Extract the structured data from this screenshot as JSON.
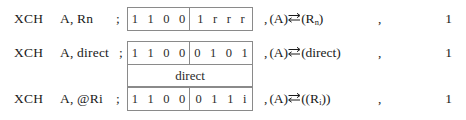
{
  "table": {
    "rows": [
      {
        "mnemonic_op": "XCH",
        "mnemonic_args": "A, Rn",
        "separator": ";",
        "opcode_high": "1 1 0 0",
        "opcode_low": "1 r r r",
        "operand_byte": null,
        "operation_prefix": ",",
        "operation_left": "(A)",
        "operation_symbol": "swap-arrows",
        "operation_right_pre": "(R",
        "operation_right_sub": "n",
        "operation_right_post": ")",
        "trailing_comma": ",",
        "cycles": "1"
      },
      {
        "mnemonic_op": "XCH",
        "mnemonic_args": "A, direct",
        "separator": ";",
        "opcode_high": "1 1 0 0",
        "opcode_low": "0 1 0 1",
        "operand_byte": "direct",
        "operation_prefix": ",",
        "operation_left": "(A)",
        "operation_symbol": "swap-arrows",
        "operation_right_pre": "(direct",
        "operation_right_sub": "",
        "operation_right_post": ")",
        "trailing_comma": ",",
        "cycles": "1"
      },
      {
        "mnemonic_op": "XCH",
        "mnemonic_args": "A, @Ri",
        "separator": ";",
        "opcode_high": "1 1 0 0",
        "opcode_low": "0 1 1 i",
        "operand_byte": null,
        "operation_prefix": ",",
        "operation_left": "(A)",
        "operation_symbol": "swap-arrows",
        "operation_right_pre": "((R",
        "operation_right_sub": "i",
        "operation_right_post": "))",
        "trailing_comma": ",",
        "cycles": "1"
      }
    ]
  },
  "colors": {
    "text": "#1a1a1a",
    "box_border": "#8a8a8a",
    "background": "#ffffff"
  }
}
